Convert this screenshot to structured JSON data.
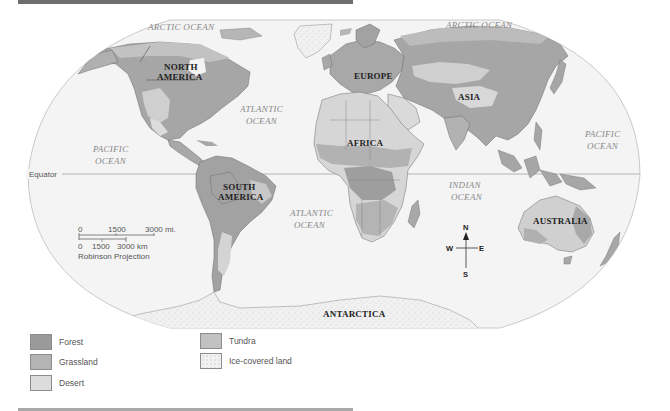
{
  "map": {
    "projection": "Robinson Projection",
    "oceans": [
      {
        "id": "arctic-1",
        "label": "ARCTIC OCEAN"
      },
      {
        "id": "arctic-2",
        "label": "ARCTIC OCEAN"
      },
      {
        "id": "atlantic-north",
        "line1": "ATLANTIC",
        "line2": "OCEAN"
      },
      {
        "id": "atlantic-south",
        "line1": "ATLANTIC",
        "line2": "OCEAN"
      },
      {
        "id": "pacific-west",
        "line1": "PACIFIC",
        "line2": "OCEAN"
      },
      {
        "id": "pacific-east",
        "line1": "PACIFIC",
        "line2": "OCEAN"
      },
      {
        "id": "indian",
        "line1": "INDIAN",
        "line2": "OCEAN"
      }
    ],
    "continents": {
      "north_america": {
        "line1": "NORTH",
        "line2": "AMERICA"
      },
      "south_america": {
        "line1": "SOUTH",
        "line2": "AMERICA"
      },
      "europe": "EUROPE",
      "asia": "ASIA",
      "africa": "AFRICA",
      "australia": "AUSTRALIA",
      "antarctica": "ANTARCTICA"
    },
    "equator_label": "Equator",
    "scale": {
      "miles_ticks": [
        "0",
        "1500",
        "3000 mi."
      ],
      "km_ticks": [
        "0",
        "1500",
        "3000 km"
      ]
    },
    "compass": {
      "n": "N",
      "s": "S",
      "e": "E",
      "w": "W"
    }
  },
  "legend": {
    "items": [
      {
        "label": "Forest",
        "color": "#9a9a9a"
      },
      {
        "label": "Grassland",
        "color": "#b4b4b4"
      },
      {
        "label": "Desert",
        "color": "#dcdcdc"
      },
      {
        "label": "Tundra",
        "color": "#c2c2c2"
      },
      {
        "label": "Ice-covered land",
        "color": "#f2f2f2"
      }
    ]
  },
  "colors": {
    "ocean": "#f4f4f4",
    "forest": "#9a9a9a",
    "grassland": "#b4b4b4",
    "desert": "#dcdcdc",
    "tundra": "#c2c2c2",
    "ice": "#f2f2f2",
    "border": "#6a6a6a"
  }
}
